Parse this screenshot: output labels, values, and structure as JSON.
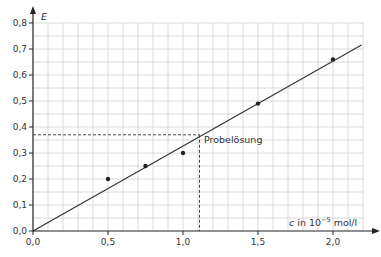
{
  "chart_data": {
    "type": "scatter",
    "title": "",
    "xlabel": "c in 10^-5 mol/l",
    "xlabel_parts": {
      "var": "c",
      "unit_prefix": " in 10",
      "exponent": "−5",
      "unit_suffix": " mol/l"
    },
    "ylabel": "E",
    "xlim": [
      0,
      2.2
    ],
    "ylim": [
      0,
      0.8
    ],
    "x_ticks": [
      0.0,
      0.5,
      1.0,
      1.5,
      2.0
    ],
    "x_tick_labels": [
      "0,0",
      "0,5",
      "1,0",
      "1,5",
      "2,0"
    ],
    "y_ticks": [
      0.0,
      0.1,
      0.2,
      0.3,
      0.4,
      0.5,
      0.6,
      0.7,
      0.8
    ],
    "y_tick_labels": [
      "0,0",
      "0,1",
      "0,2",
      "0,3",
      "0,4",
      "0,5",
      "0,6",
      "0,7",
      "0,8"
    ],
    "grid": true,
    "grid_minor_x_step": 0.1,
    "grid_minor_y_step": 0.05,
    "series": [
      {
        "name": "Messwerte",
        "x": [
          0.5,
          0.75,
          1.0,
          1.5,
          2.0
        ],
        "y": [
          0.2,
          0.25,
          0.3,
          0.49,
          0.66
        ]
      }
    ],
    "fit_line": {
      "x": [
        0.0,
        2.19
      ],
      "y": [
        0.0,
        0.715
      ],
      "slope": 0.327
    },
    "annotation": {
      "label": "Probelösung",
      "x": 1.11,
      "y": 0.37
    },
    "colors": {
      "line": "#333333",
      "grid": "#d0d0d0",
      "points": "#222222",
      "axis": "#222222"
    }
  }
}
